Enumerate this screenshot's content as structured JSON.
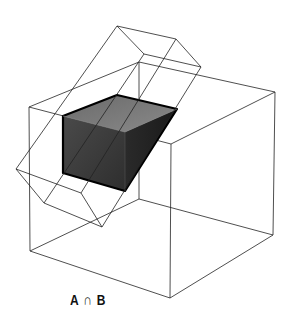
{
  "figure": {
    "caption": "A ∩ B"
  },
  "colors": {
    "line": "#222222",
    "solid_front": "#3c3c3c",
    "solid_top": "#707070",
    "solid_side": "#2a2a2a",
    "solid_outline": "#000000"
  }
}
